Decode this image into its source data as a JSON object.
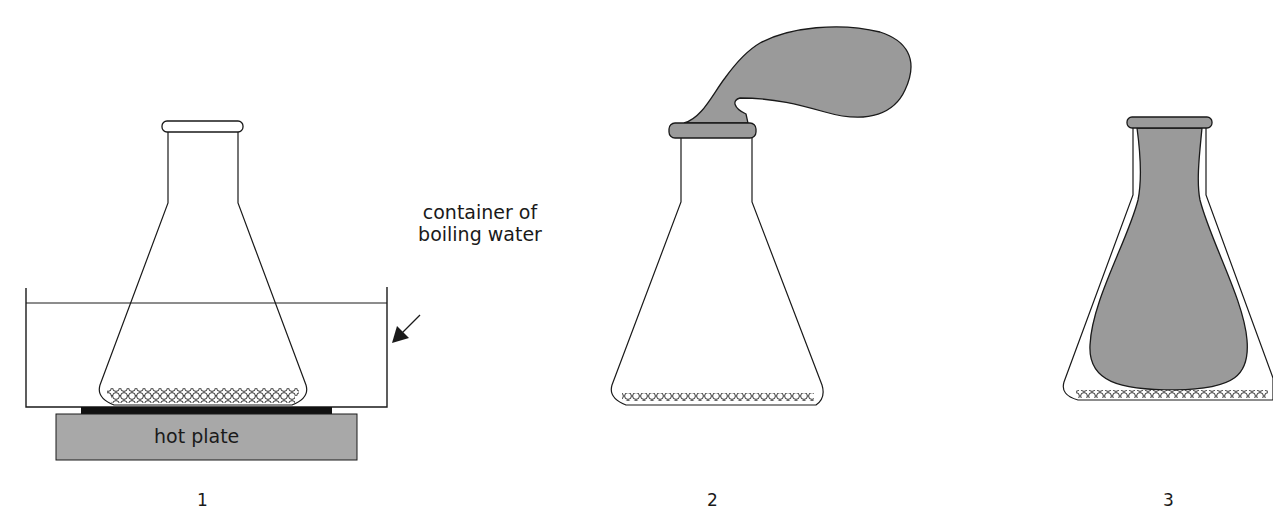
{
  "diagram": {
    "colors": {
      "stroke": "#1a1a1a",
      "balloon_fill": "#9a9a9a",
      "hotplate_fill": "#a8a8a8",
      "heater_fill": "#111111",
      "background": "#ffffff"
    },
    "panels": [
      {
        "step": "1",
        "description": "Flask with glass beads in container of boiling water on hot plate",
        "annotation_line1": "container of",
        "annotation_line2": "boiling water",
        "hotplate_label": "hot plate"
      },
      {
        "step": "2",
        "description": "Flask with inflated balloon stretched over neck"
      },
      {
        "step": "3",
        "description": "Balloon pulled inside the flask"
      }
    ]
  }
}
